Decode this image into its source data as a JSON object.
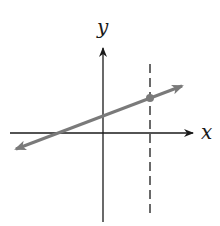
{
  "diagram": {
    "type": "coordinate-plane",
    "x_axis_label": "x",
    "y_axis_label": "y",
    "colors": {
      "axes": "#1a1a1a",
      "line": "#7a7a7a",
      "dashed_line": "#1a1a1a",
      "point": "#7a7a7a",
      "background": "#ffffff"
    },
    "elements": [
      {
        "kind": "axis",
        "name": "x-axis",
        "direction": "horizontal",
        "arrow": "right"
      },
      {
        "kind": "axis",
        "name": "y-axis",
        "direction": "vertical",
        "arrow": "up"
      },
      {
        "kind": "line",
        "name": "linear-function",
        "slope": "positive",
        "arrows": "both ends",
        "y_intercept": "positive",
        "x_intercept": "negative"
      },
      {
        "kind": "dashed-vertical-line",
        "name": "vertical-line",
        "position": "positive x"
      },
      {
        "kind": "point",
        "name": "intersection-point",
        "description": "intersection of line and dashed vertical line"
      }
    ]
  }
}
